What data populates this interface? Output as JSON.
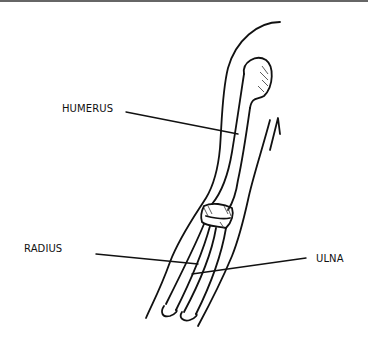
{
  "diagram": {
    "labels": {
      "humerus": "HUMERUS",
      "radius": "RADIUS",
      "ulna": "ULNA"
    },
    "colors": {
      "stroke": "#111111",
      "background": "#ffffff",
      "border": "#666666"
    }
  }
}
